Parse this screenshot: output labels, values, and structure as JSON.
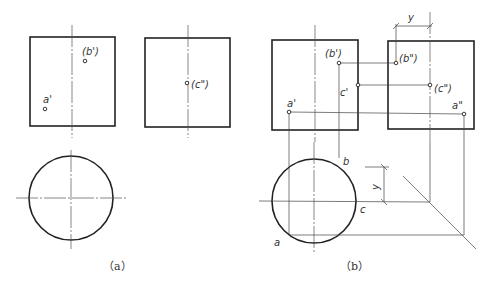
{
  "figure_a": {
    "caption": "（a）",
    "front_view": {
      "points": [
        {
          "label": "(b')"
        },
        {
          "label": "a'"
        }
      ]
    },
    "side_view": {
      "points": [
        {
          "label": "(c\")"
        }
      ]
    },
    "top_view": {
      "shape": "circle"
    }
  },
  "figure_b": {
    "caption": "（b）",
    "front_view": {
      "points": [
        {
          "label": "(b')"
        },
        {
          "label": "c'"
        },
        {
          "label": "a'"
        }
      ]
    },
    "side_view": {
      "points": [
        {
          "label": "(b\")"
        },
        {
          "label": "(c\")"
        },
        {
          "label": "a\""
        }
      ]
    },
    "top_view": {
      "points": [
        {
          "label": "b"
        },
        {
          "label": "c"
        },
        {
          "label": "a"
        }
      ]
    },
    "dimension_top": "y",
    "dimension_bottom": "y"
  }
}
